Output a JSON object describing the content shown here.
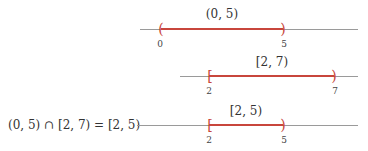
{
  "colors": {
    "interval": "#c8463c",
    "axis": "#9a9a9a",
    "text": "#333333"
  },
  "number_lines": [
    {
      "label": "(0, 5)",
      "left_bracket": "(",
      "right_bracket": ")",
      "left_value": "0",
      "right_value": "5"
    },
    {
      "label": "[2, 7)",
      "left_bracket": "[",
      "right_bracket": ")",
      "left_value": "2",
      "right_value": "7"
    },
    {
      "label": "[2, 5)",
      "left_bracket": "[",
      "right_bracket": ")",
      "left_value": "2",
      "right_value": "5",
      "equation": "(0, 5) ∩ [2, 7) = [2, 5)"
    }
  ]
}
